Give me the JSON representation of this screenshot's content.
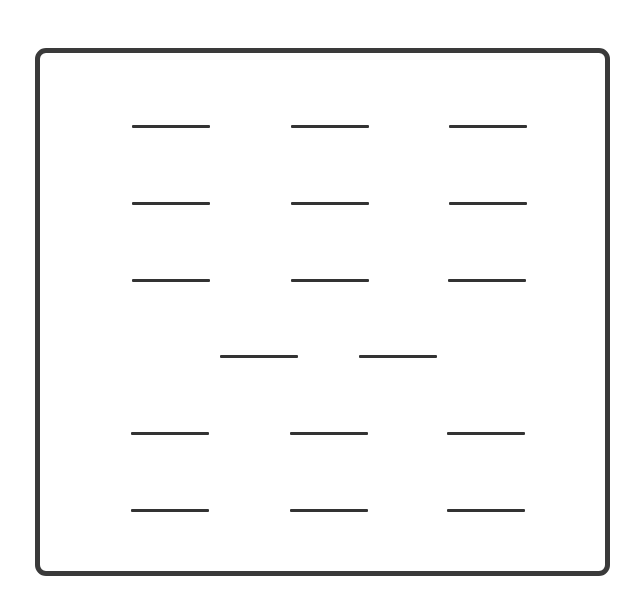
{
  "diagram": {
    "frame": {
      "left": 35,
      "top": 48,
      "width": 565,
      "height": 518,
      "border_color": "#3a3a3a"
    },
    "line_color": "#333333",
    "line_width": 78,
    "rows": [
      {
        "y": 125,
        "xs": [
          132,
          291,
          449
        ]
      },
      {
        "y": 202,
        "xs": [
          132,
          291,
          449
        ]
      },
      {
        "y": 279,
        "xs": [
          132,
          291,
          448
        ]
      },
      {
        "y": 355,
        "xs": [
          220,
          359
        ]
      },
      {
        "y": 432,
        "xs": [
          131,
          290,
          447
        ]
      },
      {
        "y": 509,
        "xs": [
          131,
          290,
          447
        ]
      }
    ]
  }
}
